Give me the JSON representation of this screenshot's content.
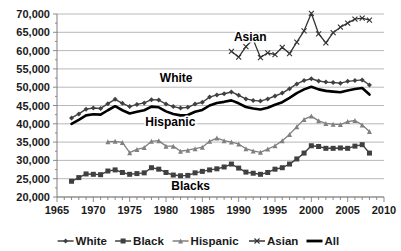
{
  "chart_data": {
    "type": "line",
    "title": "",
    "subtitle": "",
    "xlabel": "",
    "ylabel": "",
    "xlim": [
      1965,
      2010
    ],
    "ylim": [
      20000,
      70000
    ],
    "grid": true,
    "legend_position": "bottom",
    "ytick_labels": [
      "70,000",
      "65,000",
      "60,000",
      "55,000",
      "50,000",
      "45,000",
      "40,000",
      "35,000",
      "30,000",
      "25,000",
      "20,000"
    ],
    "ytick_values": [
      70000,
      65000,
      60000,
      55000,
      50000,
      45000,
      40000,
      35000,
      30000,
      25000,
      20000
    ],
    "xtick_labels": [
      "1965",
      "1970",
      "1975",
      "1980",
      "1985",
      "1990",
      "1995",
      "2000",
      "2005",
      "2010"
    ],
    "xtick_values": [
      1965,
      1970,
      1975,
      1980,
      1985,
      1990,
      1995,
      2000,
      2005,
      2010
    ],
    "minor_xtick_step": 1,
    "annotations": [
      {
        "text": "Asian",
        "x": 1991.6,
        "y": 62600,
        "name": "asian-series-label"
      },
      {
        "text": "White",
        "x": 1981.4,
        "y": 51500,
        "name": "white-series-label"
      },
      {
        "text": "Hispanic",
        "x": 1980.6,
        "y": 39400,
        "name": "hispanic-series-label"
      },
      {
        "text": "Blacks",
        "x": 1983.4,
        "y": 21900,
        "name": "blacks-series-label"
      }
    ],
    "series": [
      {
        "name": "White",
        "marker": "diamond",
        "color": "#404040",
        "line_width": 1.4,
        "x": [
          1967,
          1968,
          1969,
          1970,
          1971,
          1972,
          1973,
          1974,
          1975,
          1976,
          1977,
          1978,
          1979,
          1980,
          1981,
          1982,
          1983,
          1984,
          1985,
          1986,
          1987,
          1988,
          1989,
          1990,
          1991,
          1992,
          1993,
          1994,
          1995,
          1996,
          1997,
          1998,
          1999,
          2000,
          2001,
          2002,
          2003,
          2004,
          2005,
          2006,
          2007,
          2008
        ],
        "values": [
          41600,
          42700,
          44000,
          44300,
          44200,
          45500,
          46700,
          45600,
          44700,
          45300,
          45700,
          46600,
          46500,
          45400,
          44700,
          44300,
          44500,
          45400,
          45900,
          47300,
          47900,
          48200,
          48700,
          47800,
          46800,
          46400,
          46200,
          46800,
          47600,
          48400,
          49600,
          50900,
          51800,
          52300,
          51700,
          51400,
          51300,
          51100,
          51600,
          51800,
          52000,
          50600
        ]
      },
      {
        "name": "Black",
        "marker": "square",
        "color": "#404040",
        "line_width": 1.4,
        "x": [
          1967,
          1968,
          1969,
          1970,
          1971,
          1972,
          1973,
          1974,
          1975,
          1976,
          1977,
          1978,
          1979,
          1980,
          1981,
          1982,
          1983,
          1984,
          1985,
          1986,
          1987,
          1988,
          1989,
          1990,
          1991,
          1992,
          1993,
          1994,
          1995,
          1996,
          1997,
          1998,
          1999,
          2000,
          2001,
          2002,
          2003,
          2004,
          2005,
          2006,
          2007,
          2008
        ],
        "values": [
          24300,
          25300,
          26300,
          26200,
          26100,
          27100,
          27400,
          26700,
          26200,
          26400,
          26600,
          28000,
          27600,
          26700,
          26000,
          25800,
          25900,
          26600,
          27000,
          27400,
          27700,
          28200,
          29000,
          27900,
          26800,
          26500,
          26200,
          26700,
          27600,
          28000,
          29000,
          30400,
          32000,
          34000,
          33800,
          33300,
          33300,
          33400,
          33300,
          33900,
          34300,
          32000
        ]
      },
      {
        "name": "Hispanic",
        "marker": "triangle",
        "color": "#808080",
        "line_width": 1.3,
        "x": [
          1972,
          1973,
          1974,
          1975,
          1976,
          1977,
          1978,
          1979,
          1980,
          1981,
          1982,
          1983,
          1984,
          1985,
          1986,
          1987,
          1988,
          1989,
          1990,
          1991,
          1992,
          1993,
          1994,
          1995,
          1996,
          1997,
          1998,
          1999,
          2000,
          2001,
          2002,
          2003,
          2004,
          2005,
          2006,
          2007,
          2008
        ],
        "values": [
          35100,
          35200,
          34900,
          32100,
          33000,
          33500,
          35200,
          35400,
          33900,
          33900,
          32500,
          32800,
          33200,
          33600,
          35200,
          36100,
          35400,
          35000,
          34500,
          33200,
          32600,
          32200,
          33100,
          34000,
          35400,
          37100,
          39200,
          41200,
          42100,
          40800,
          40100,
          39900,
          39800,
          40600,
          40900,
          39700,
          37900
        ]
      },
      {
        "name": "Asian",
        "marker": "x",
        "color": "#333333",
        "line_width": 1.3,
        "x": [
          1989,
          1990,
          1991,
          1992,
          1993,
          1994,
          1995,
          1996,
          1997,
          1998,
          1999,
          2000,
          2001,
          2002,
          2003,
          2004,
          2005,
          2006,
          2007,
          2008
        ],
        "values": [
          59800,
          58200,
          61100,
          63000,
          58100,
          59400,
          58900,
          60900,
          59200,
          62300,
          65400,
          70200,
          64600,
          62100,
          64900,
          66400,
          67500,
          68600,
          68900,
          68300
        ]
      },
      {
        "name": "All",
        "marker": "none",
        "color": "#000000",
        "line_width": 2.6,
        "x": [
          1967,
          1968,
          1969,
          1970,
          1971,
          1972,
          1973,
          1974,
          1975,
          1976,
          1977,
          1978,
          1979,
          1980,
          1981,
          1982,
          1983,
          1984,
          1985,
          1986,
          1987,
          1988,
          1989,
          1990,
          1991,
          1992,
          1993,
          1994,
          1995,
          1996,
          1997,
          1998,
          1999,
          2000,
          2001,
          2002,
          2003,
          2004,
          2005,
          2006,
          2007,
          2008
        ],
        "values": [
          40000,
          41100,
          42300,
          42600,
          42500,
          43700,
          44800,
          43700,
          42800,
          43300,
          43700,
          44700,
          44500,
          43400,
          42700,
          42300,
          42400,
          43300,
          43800,
          45000,
          45700,
          46000,
          46400,
          45600,
          44600,
          44200,
          43900,
          44400,
          45200,
          45900,
          47100,
          48400,
          49400,
          50100,
          49400,
          49000,
          48800,
          48600,
          49100,
          49500,
          49800,
          48000
        ]
      }
    ],
    "legend": [
      {
        "label": "White",
        "marker": "diamond",
        "color": "#404040"
      },
      {
        "label": "Black",
        "marker": "square",
        "color": "#404040"
      },
      {
        "label": "Hispanic",
        "marker": "triangle",
        "color": "#808080"
      },
      {
        "label": "Asian",
        "marker": "x",
        "color": "#333333"
      },
      {
        "label": "All",
        "marker": "none",
        "color": "#000000"
      }
    ]
  }
}
